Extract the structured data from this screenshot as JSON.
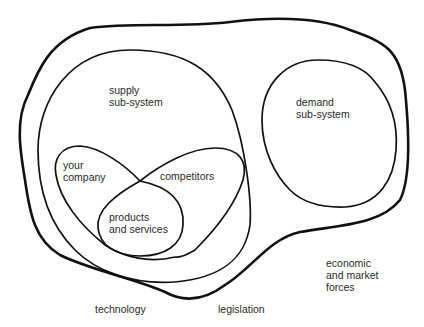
{
  "diagram": {
    "colors": {
      "stroke": "#111111",
      "text": "#2a2a2a",
      "background": "#ffffff"
    },
    "regions": {
      "environment": {
        "label_economic": "economic\nand market\nforces",
        "label_technology": "technology",
        "label_legislation": "legislation"
      },
      "supply": {
        "label": "supply\nsub-system"
      },
      "demand": {
        "label": "demand\nsub-system"
      },
      "your_company": {
        "label": "your\ncompany"
      },
      "competitors": {
        "label": "competitors"
      },
      "products": {
        "label": "products\nand services"
      }
    }
  }
}
